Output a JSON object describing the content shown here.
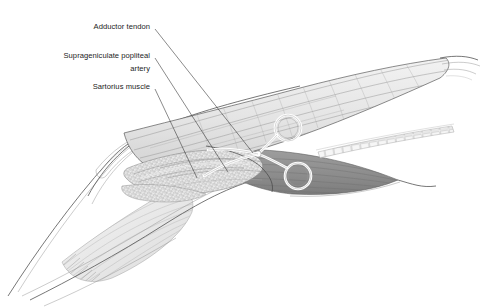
{
  "figure": {
    "type": "anatomical-surgical-illustration",
    "background_color": "#ffffff",
    "line_color": "#4a4a4a",
    "label_color": "#1c1c1c",
    "labels": [
      {
        "id": "adductor-tendon",
        "text": "Adductor tendon",
        "text_x": 150,
        "text_y": 26,
        "anchor": "end",
        "leader_from_x": 155,
        "leader_from_y": 29,
        "leader_to_x": 253,
        "leader_to_y": 153
      },
      {
        "id": "suprageniculate-popliteal-artery",
        "text_line1": "Suprageniculate popliteal",
        "text_line2": "artery",
        "text_x": 150,
        "text_y_line1": 55,
        "text_y_line2": 68,
        "anchor": "end",
        "leader_from_x": 155,
        "leader_from_y": 58,
        "leader_to_x": 228,
        "leader_to_y": 172
      },
      {
        "id": "sartorius-muscle",
        "text": "Sartorius muscle",
        "text_x": 150,
        "text_y": 92,
        "anchor": "end",
        "leader_from_x": 155,
        "leader_from_y": 89,
        "leader_to_x": 197,
        "leader_to_y": 178
      }
    ],
    "structures": [
      {
        "id": "sartorius-muscle-belly",
        "kind": "muscle",
        "tone": "#e9e9e9",
        "note": "large pale muscle belly upper right"
      },
      {
        "id": "adductor-magnus-muscle",
        "kind": "muscle",
        "tone": "#8f8f8f",
        "note": "dark shaded muscle lower right"
      },
      {
        "id": "popliteal-artery-bundle",
        "kind": "vessel",
        "tone": "#dcdcdc",
        "note": "stippled neurovascular bundle centre"
      },
      {
        "id": "segmented-band",
        "kind": "band",
        "tone": "#f2f2f2",
        "note": "ladder-segmented band to right"
      },
      {
        "id": "distal-muscle-group",
        "kind": "muscle",
        "tone": "#ededed",
        "note": "striated muscle lower left"
      },
      {
        "id": "skin-fascia-flap",
        "kind": "fascia",
        "tone": "#ffffff",
        "note": "retracted skin/fascia edge left"
      },
      {
        "id": "surgical-scissors",
        "kind": "instrument",
        "tone": "#ffffff",
        "note": "ring-handled instrument centre"
      }
    ]
  }
}
